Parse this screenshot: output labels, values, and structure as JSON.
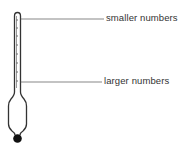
{
  "diagram": {
    "labels": {
      "top": "smaller numbers",
      "bottom": "larger numbers"
    },
    "colors": {
      "stroke": "#333333",
      "weight": "#111111",
      "background": "#ffffff"
    }
  }
}
